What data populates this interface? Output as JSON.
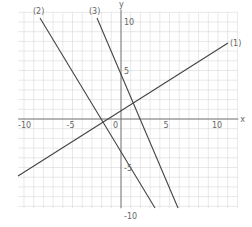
{
  "graph": {
    "x_axis_label": "x",
    "y_axis_label": "y",
    "origin_label": "0",
    "x_ticks": [
      {
        "v": -10,
        "t": "-10"
      },
      {
        "v": -5,
        "t": "-5"
      },
      {
        "v": 5,
        "t": "5"
      },
      {
        "v": 10,
        "t": "10"
      }
    ],
    "y_ticks": [
      {
        "v": 10,
        "t": "10"
      },
      {
        "v": 5,
        "t": "5"
      },
      {
        "v": -5,
        "t": "-5"
      },
      {
        "v": -10,
        "t": "-10"
      }
    ],
    "lines": [
      {
        "label": "(1)",
        "x1": 18,
        "y1": 176,
        "x2": 228,
        "y2": 43
      },
      {
        "label": "(2)",
        "x1": 40,
        "y1": 18,
        "x2": 155,
        "y2": 208
      },
      {
        "label": "(3)",
        "x1": 97,
        "y1": 18,
        "x2": 178,
        "y2": 208
      }
    ],
    "colors": {
      "grid": "#d9d9d9",
      "axis": "#777777",
      "line": "#444444",
      "text": "#666666"
    }
  }
}
